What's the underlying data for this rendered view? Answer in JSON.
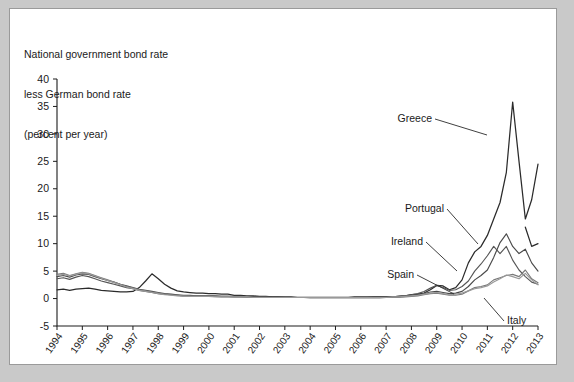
{
  "title": {
    "line1": "National government bond rate",
    "line2": "less German bond rate",
    "line3": "(percent per year)"
  },
  "chart_data": {
    "type": "line",
    "title": "National government bond rate less German bond rate (percent per year)",
    "subtitle": "(percent per year)",
    "xlabel": "",
    "ylabel": "percent per year",
    "ylim": [
      -5,
      40
    ],
    "yticks": [
      -5,
      0,
      5,
      10,
      15,
      20,
      25,
      30,
      35,
      40
    ],
    "xlim": [
      1994,
      2013
    ],
    "xticks": [
      1994,
      1995,
      1996,
      1997,
      1998,
      1999,
      2000,
      2001,
      2002,
      2003,
      2004,
      2005,
      2006,
      2007,
      2008,
      2009,
      2010,
      2011,
      2012,
      2013
    ],
    "xtick_labels": [
      "1994",
      "1995",
      "1996",
      "1997",
      "1998",
      "1999",
      "2000",
      "2001",
      "2002",
      "2003",
      "2004",
      "2005",
      "2006",
      "2007",
      "2008",
      "2009",
      "2010",
      "2011",
      "2012",
      "2013"
    ],
    "grid": false,
    "legend": "inline-annotations",
    "x": [
      1994.0,
      1994.25,
      1994.5,
      1994.75,
      1995.0,
      1995.25,
      1995.5,
      1995.75,
      1996.0,
      1996.25,
      1996.5,
      1996.75,
      1997.0,
      1997.25,
      1997.5,
      1997.75,
      1998.0,
      1998.25,
      1998.5,
      1998.75,
      1999.0,
      1999.25,
      1999.5,
      1999.75,
      2000.0,
      2000.25,
      2000.5,
      2000.75,
      2001.0,
      2001.25,
      2001.5,
      2001.75,
      2002.0,
      2002.25,
      2002.5,
      2002.75,
      2003.0,
      2003.25,
      2003.5,
      2003.75,
      2004.0,
      2004.25,
      2004.5,
      2004.75,
      2005.0,
      2005.25,
      2005.5,
      2005.75,
      2006.0,
      2006.25,
      2006.5,
      2006.75,
      2007.0,
      2007.25,
      2007.5,
      2007.75,
      2008.0,
      2008.25,
      2008.5,
      2008.75,
      2009.0,
      2009.25,
      2009.5,
      2009.75,
      2010.0,
      2010.25,
      2010.5,
      2010.75,
      2011.0,
      2011.25,
      2011.5,
      2011.75,
      2012.0,
      2012.25,
      2012.5,
      2012.75,
      2013.0
    ],
    "series": [
      {
        "name": "Greece",
        "color": "#2b2b2b",
        "width": 1.25,
        "values": [
          1.6,
          1.7,
          1.5,
          1.7,
          1.8,
          1.9,
          1.7,
          1.5,
          1.4,
          1.3,
          1.2,
          1.2,
          1.3,
          2.0,
          3.2,
          4.5,
          3.6,
          2.6,
          1.9,
          1.4,
          1.2,
          1.1,
          1.0,
          1.0,
          0.9,
          0.9,
          0.8,
          0.8,
          0.6,
          0.6,
          0.5,
          0.5,
          0.4,
          0.4,
          0.3,
          0.3,
          0.3,
          0.3,
          0.2,
          0.2,
          0.2,
          0.2,
          0.2,
          0.2,
          0.2,
          0.2,
          0.2,
          0.3,
          0.3,
          0.3,
          0.3,
          0.3,
          0.3,
          0.3,
          0.4,
          0.5,
          0.7,
          0.8,
          1.0,
          1.6,
          2.4,
          2.3,
          1.6,
          2.0,
          3.4,
          6.5,
          8.5,
          9.5,
          11.5,
          14.5,
          17.5,
          23.0,
          35.8,
          25.0,
          14.5,
          18.0,
          24.5
        ]
      },
      {
        "name": "Greece-tail",
        "color": "#2b2b2b",
        "width": 1.25,
        "values": [
          null,
          null,
          null,
          null,
          null,
          null,
          null,
          null,
          null,
          null,
          null,
          null,
          null,
          null,
          null,
          null,
          null,
          null,
          null,
          null,
          null,
          null,
          null,
          null,
          null,
          null,
          null,
          null,
          null,
          null,
          null,
          null,
          null,
          null,
          null,
          null,
          null,
          null,
          null,
          null,
          null,
          null,
          null,
          null,
          null,
          null,
          null,
          null,
          null,
          null,
          null,
          null,
          null,
          null,
          null,
          null,
          null,
          null,
          null,
          null,
          null,
          null,
          null,
          null,
          null,
          null,
          null,
          null,
          null,
          null,
          null,
          null,
          null,
          null,
          13.0,
          9.5,
          10.0
        ]
      },
      {
        "name": "Portugal",
        "color": "#4a4a4a",
        "width": 1.15,
        "values": [
          4.0,
          4.2,
          3.9,
          4.3,
          4.5,
          4.4,
          4.0,
          3.6,
          3.3,
          3.0,
          2.6,
          2.3,
          2.0,
          1.7,
          1.5,
          1.3,
          1.1,
          0.9,
          0.8,
          0.7,
          0.6,
          0.6,
          0.5,
          0.5,
          0.5,
          0.5,
          0.4,
          0.4,
          0.4,
          0.4,
          0.3,
          0.3,
          0.3,
          0.3,
          0.3,
          0.3,
          0.2,
          0.2,
          0.2,
          0.2,
          0.2,
          0.2,
          0.2,
          0.2,
          0.2,
          0.2,
          0.2,
          0.2,
          0.2,
          0.2,
          0.3,
          0.3,
          0.3,
          0.3,
          0.4,
          0.5,
          0.6,
          0.7,
          0.9,
          1.2,
          1.3,
          1.1,
          0.9,
          1.0,
          1.3,
          2.2,
          3.4,
          4.2,
          5.2,
          7.5,
          10.2,
          11.8,
          9.5,
          8.2,
          9.0,
          6.5,
          5.0
        ]
      },
      {
        "name": "Ireland",
        "color": "#565656",
        "width": 1.15,
        "values": [
          3.6,
          3.8,
          3.5,
          3.9,
          4.2,
          4.0,
          3.6,
          3.2,
          2.9,
          2.6,
          2.3,
          2.0,
          1.8,
          1.5,
          1.3,
          1.1,
          0.9,
          0.8,
          0.7,
          0.6,
          0.5,
          0.5,
          0.5,
          0.5,
          0.5,
          0.4,
          0.4,
          0.4,
          0.3,
          0.3,
          0.3,
          0.3,
          0.3,
          0.3,
          0.2,
          0.2,
          0.2,
          0.2,
          0.2,
          0.2,
          0.2,
          0.2,
          0.2,
          0.2,
          0.2,
          0.2,
          0.2,
          0.2,
          0.2,
          0.2,
          0.2,
          0.2,
          0.3,
          0.3,
          0.4,
          0.5,
          0.7,
          0.9,
          1.3,
          1.9,
          2.4,
          2.0,
          1.5,
          1.6,
          2.2,
          3.2,
          5.0,
          6.3,
          7.8,
          9.5,
          8.2,
          9.5,
          7.0,
          5.2,
          4.0,
          3.0,
          2.6
        ]
      },
      {
        "name": "Spain",
        "color": "#7a7a7a",
        "width": 1.15,
        "values": [
          4.4,
          4.6,
          4.2,
          4.5,
          4.8,
          4.6,
          4.2,
          3.8,
          3.4,
          3.0,
          2.6,
          2.2,
          1.9,
          1.6,
          1.4,
          1.2,
          1.0,
          0.8,
          0.7,
          0.6,
          0.5,
          0.4,
          0.4,
          0.4,
          0.4,
          0.4,
          0.3,
          0.3,
          0.3,
          0.3,
          0.3,
          0.2,
          0.2,
          0.2,
          0.2,
          0.2,
          0.2,
          0.2,
          0.2,
          0.2,
          0.1,
          0.1,
          0.1,
          0.1,
          0.1,
          0.1,
          0.1,
          0.1,
          0.1,
          0.1,
          0.1,
          0.1,
          0.2,
          0.2,
          0.2,
          0.3,
          0.4,
          0.5,
          0.7,
          0.9,
          1.0,
          0.8,
          0.6,
          0.6,
          0.8,
          1.4,
          2.0,
          2.2,
          2.5,
          3.4,
          3.8,
          4.2,
          4.4,
          4.0,
          5.2,
          3.6,
          2.9
        ]
      },
      {
        "name": "Italy",
        "color": "#999999",
        "width": 1.15,
        "values": [
          4.2,
          4.4,
          4.1,
          4.4,
          4.7,
          4.5,
          4.1,
          3.7,
          3.3,
          2.9,
          2.5,
          2.1,
          1.8,
          1.5,
          1.3,
          1.1,
          0.9,
          0.7,
          0.6,
          0.5,
          0.4,
          0.4,
          0.4,
          0.4,
          0.4,
          0.3,
          0.3,
          0.3,
          0.3,
          0.3,
          0.3,
          0.2,
          0.2,
          0.2,
          0.2,
          0.2,
          0.2,
          0.2,
          0.2,
          0.2,
          0.2,
          0.2,
          0.2,
          0.2,
          0.2,
          0.2,
          0.2,
          0.2,
          0.2,
          0.2,
          0.2,
          0.2,
          0.2,
          0.3,
          0.3,
          0.4,
          0.5,
          0.6,
          0.8,
          1.0,
          1.1,
          0.9,
          0.7,
          0.8,
          1.0,
          1.4,
          1.8,
          2.0,
          2.3,
          3.0,
          3.6,
          4.3,
          4.0,
          3.6,
          4.6,
          3.4,
          2.5
        ]
      }
    ],
    "annotations": [
      {
        "name": "Greece",
        "text": "Greece",
        "lx": 422,
        "ly": 113,
        "px": 477,
        "py": 126,
        "anchor": "end"
      },
      {
        "name": "Portugal",
        "text": "Portugal",
        "lx": 434,
        "ly": 203,
        "px": 468,
        "py": 235,
        "anchor": "end"
      },
      {
        "name": "Ireland",
        "text": "Ireland",
        "lx": 413,
        "ly": 236,
        "px": 447,
        "py": 262,
        "anchor": "end"
      },
      {
        "name": "Spain",
        "text": "Spain",
        "lx": 404,
        "ly": 269,
        "px": 444,
        "py": 285,
        "anchor": "end"
      },
      {
        "name": "Italy",
        "text": "Italy",
        "lx": 497,
        "ly": 315,
        "px": 474,
        "py": 289,
        "anchor": "start"
      }
    ]
  }
}
